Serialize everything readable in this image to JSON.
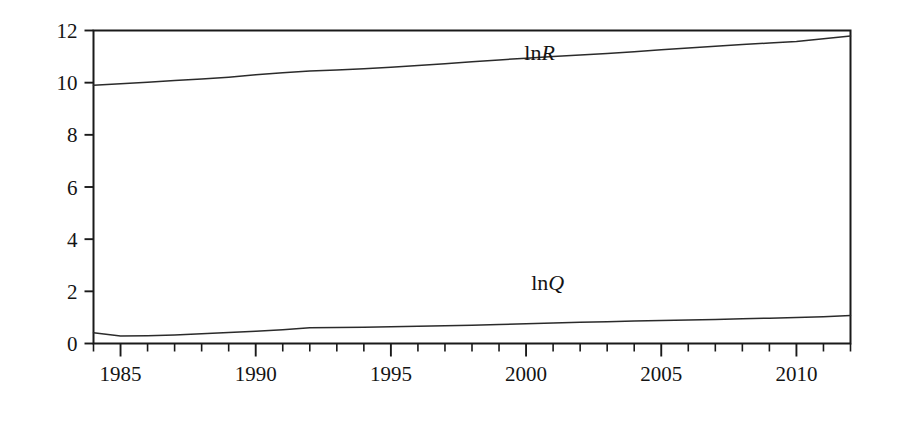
{
  "chart_data": {
    "type": "line",
    "title": "",
    "subtitle": "",
    "xlabel": "",
    "ylabel": "",
    "xlim": [
      1984,
      2012
    ],
    "ylim": [
      0,
      12
    ],
    "grid": false,
    "legend_position": "inline-labels",
    "y_ticks": [
      0,
      2,
      4,
      6,
      8,
      10,
      12
    ],
    "y_tick_labels": [
      "0",
      "2",
      "4",
      "6",
      "8",
      "10",
      "12"
    ],
    "x_ticks": [
      1985,
      1990,
      1995,
      2000,
      2005,
      2010
    ],
    "x_tick_labels": [
      "1985",
      "1990",
      "1995",
      "2000",
      "2005",
      "2010"
    ],
    "x_minor_tick_step": 1,
    "x": [
      1984,
      1985,
      1986,
      1987,
      1988,
      1989,
      1990,
      1991,
      1992,
      1993,
      1994,
      1995,
      1996,
      1997,
      1998,
      1999,
      2000,
      2001,
      2002,
      2003,
      2004,
      2005,
      2006,
      2007,
      2008,
      2009,
      2010,
      2011,
      2012
    ],
    "series": [
      {
        "name": "lnR",
        "label_text": "ln",
        "label_italic": "R",
        "label_x": 2000.5,
        "label_y": 10.85,
        "color": "#2b2b2b",
        "values": [
          9.9,
          9.96,
          10.02,
          10.08,
          10.14,
          10.21,
          10.3,
          10.38,
          10.45,
          10.49,
          10.53,
          10.59,
          10.66,
          10.73,
          10.8,
          10.87,
          10.94,
          11.0,
          11.06,
          11.12,
          11.19,
          11.26,
          11.33,
          11.4,
          11.46,
          11.52,
          11.58,
          11.68,
          11.79
        ]
      },
      {
        "name": "lnQ",
        "label_text": "ln",
        "label_italic": "Q",
        "label_x": 2000.8,
        "label_y": 2.05,
        "color": "#2b2b2b",
        "values": [
          0.41,
          0.29,
          0.3,
          0.33,
          0.37,
          0.42,
          0.47,
          0.53,
          0.6,
          0.61,
          0.62,
          0.64,
          0.66,
          0.68,
          0.7,
          0.73,
          0.76,
          0.79,
          0.81,
          0.83,
          0.86,
          0.88,
          0.9,
          0.92,
          0.95,
          0.97,
          1.0,
          1.03,
          1.07
        ]
      }
    ]
  }
}
